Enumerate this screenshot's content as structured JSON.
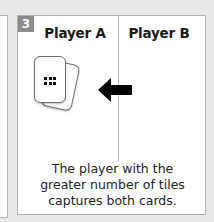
{
  "step": {
    "number": "3"
  },
  "columns": [
    {
      "label": "Player A"
    },
    {
      "label": "Player B"
    }
  ],
  "cards": {
    "front": {
      "tiles": 6,
      "icon": "dot-grid-3x2"
    },
    "back": {
      "tiles": 2,
      "icon": "dot-pair"
    }
  },
  "arrow": {
    "direction": "left",
    "icon": "arrow-left-icon"
  },
  "caption": {
    "lines": [
      "The player with the",
      "greater number of tiles",
      "captures both cards."
    ]
  },
  "colors": {
    "background": "#e9e9e9",
    "panel": "#ffffff",
    "badge": "#8c8c8c",
    "text": "#1a1a1a",
    "arrow": "#000000"
  }
}
